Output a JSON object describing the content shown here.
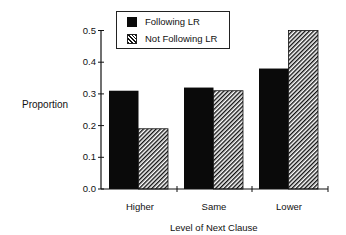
{
  "chart_data": {
    "type": "bar",
    "title": "",
    "xlabel": "Level of Next Clause",
    "ylabel": "Proportion",
    "categories": [
      "Higher",
      "Same",
      "Lower"
    ],
    "series": [
      {
        "name": "Following LR",
        "values": [
          0.31,
          0.32,
          0.38
        ],
        "fill": "solid",
        "color": "#0a0a0a"
      },
      {
        "name": "Not Following LR",
        "values": [
          0.19,
          0.31,
          0.5
        ],
        "fill": "hatched",
        "color": "#111111"
      }
    ],
    "ylim": [
      0.0,
      0.5
    ],
    "yticks": [
      "0.0",
      "0.1",
      "0.2",
      "0.3",
      "0.4",
      "0.5"
    ],
    "grid": false,
    "legend_position": "top-inside"
  },
  "legend": {
    "items": [
      {
        "label": "Following LR"
      },
      {
        "label": "Not Following LR"
      }
    ]
  }
}
